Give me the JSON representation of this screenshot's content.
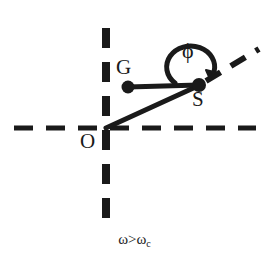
{
  "figure": {
    "title": "",
    "background_color": "#ffffff",
    "stroke_color": "#1a1a1a",
    "width": 269,
    "height": 262,
    "labels": {
      "point_g": "G",
      "point_s": "S",
      "origin": "O",
      "angle": "ϕ",
      "condition": "ω>ω",
      "condition_subscript": "c"
    },
    "geometry": {
      "origin": {
        "x": 106,
        "y": 128
      },
      "point_g": {
        "x": 128,
        "y": 87
      },
      "point_s": {
        "x": 199,
        "y": 85
      },
      "horizontal_axis": {
        "x1": 14,
        "y1": 128,
        "x2": 256,
        "y2": 128,
        "style": "dashed"
      },
      "vertical_axis": {
        "x1": 106,
        "y1": 28,
        "x2": 106,
        "y2": 226,
        "style": "dashed"
      },
      "ray_from_s": {
        "x1": 199,
        "y1": 85,
        "x2": 258,
        "y2": 50,
        "style": "dashed"
      },
      "segment_gs": {
        "x1": 128,
        "y1": 87,
        "x2": 199,
        "y2": 85,
        "style": "solid"
      },
      "segment_os": {
        "x1": 106,
        "y1": 128,
        "x2": 199,
        "y2": 85,
        "style": "solid"
      },
      "angle_arc": {
        "center_x": 199,
        "center_y": 85,
        "radius": 24,
        "start_deg": 180,
        "end_deg": 330
      }
    }
  }
}
